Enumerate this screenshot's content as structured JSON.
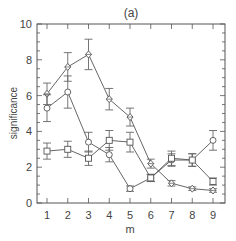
{
  "chart_data": {
    "type": "line",
    "title": "(a)",
    "xlabel": "m",
    "ylabel": "significance",
    "x": [
      1,
      2,
      3,
      4,
      5,
      6,
      7,
      8,
      9
    ],
    "xlim": [
      0.5,
      9.6
    ],
    "ylim": [
      0,
      10
    ],
    "xticks": [
      1,
      2,
      3,
      4,
      5,
      6,
      7,
      8,
      9
    ],
    "yticks": [
      0,
      2,
      4,
      6,
      8,
      10
    ],
    "grid": false,
    "legend": null,
    "series": [
      {
        "name": "diamond",
        "marker": "diamond",
        "values": [
          6.1,
          7.6,
          8.3,
          5.8,
          4.8,
          2.2,
          1.1,
          0.8,
          0.7
        ],
        "errors": [
          0.6,
          0.8,
          0.85,
          0.6,
          0.5,
          0.25,
          0.15,
          0.1,
          0.1
        ]
      },
      {
        "name": "circle",
        "marker": "circle",
        "values": [
          5.3,
          6.2,
          3.4,
          2.7,
          0.8,
          1.4,
          2.4,
          2.4,
          3.5
        ],
        "errors": [
          0.75,
          0.9,
          0.55,
          0.4,
          0.15,
          0.2,
          0.35,
          0.35,
          0.55
        ]
      },
      {
        "name": "square",
        "marker": "square",
        "values": [
          2.9,
          3.0,
          2.5,
          3.5,
          3.4,
          1.4,
          2.5,
          2.4,
          1.2
        ],
        "errors": [
          0.45,
          0.45,
          0.4,
          0.55,
          0.55,
          0.2,
          0.4,
          0.35,
          0.2
        ]
      }
    ]
  }
}
